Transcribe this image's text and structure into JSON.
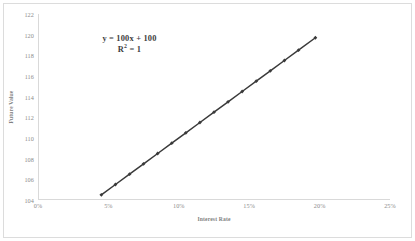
{
  "chart_data": {
    "type": "line",
    "title": "",
    "xlabel": "Interest Rate",
    "ylabel": "Future Value",
    "grid": false,
    "legend": "none",
    "xlim": [
      0,
      25
    ],
    "ylim": [
      104,
      122
    ],
    "x_tick_labels": [
      "0%",
      "5%",
      "10%",
      "15%",
      "20%",
      "25%"
    ],
    "x_tick_values": [
      0,
      5,
      10,
      15,
      20,
      25
    ],
    "y_tick_labels": [
      "104",
      "106",
      "108",
      "110",
      "112",
      "114",
      "116",
      "118",
      "120",
      "122"
    ],
    "y_tick_values": [
      104,
      106,
      108,
      110,
      112,
      114,
      116,
      118,
      120,
      122
    ],
    "series": [
      {
        "name": "Future Value",
        "marker": "diamond",
        "color": "#3a3a3a",
        "x": [
          4.5,
          5.5,
          6.5,
          7.5,
          8.5,
          9.5,
          10.5,
          11.5,
          12.5,
          13.5,
          14.5,
          15.5,
          16.5,
          17.5,
          18.5,
          19.7
        ],
        "values": [
          104.5,
          105.5,
          106.5,
          107.5,
          108.5,
          109.5,
          110.5,
          111.5,
          112.5,
          113.5,
          114.5,
          115.5,
          116.5,
          117.5,
          118.5,
          119.7
        ]
      }
    ],
    "annotations": {
      "equation": "y = 100x + 100",
      "r_squared_label": "R",
      "r_squared_exponent": "2",
      "r_squared_value": "= 1"
    }
  },
  "style": {
    "line_color": "#3a3a3a",
    "axis_color": "#d9d9d9",
    "tick_text_color": "#8c8c8c",
    "title_text_color": "#808080",
    "annotation_color": "#3d3d3d",
    "frame_color": "#dcdcdc",
    "background": "#ffffff"
  }
}
